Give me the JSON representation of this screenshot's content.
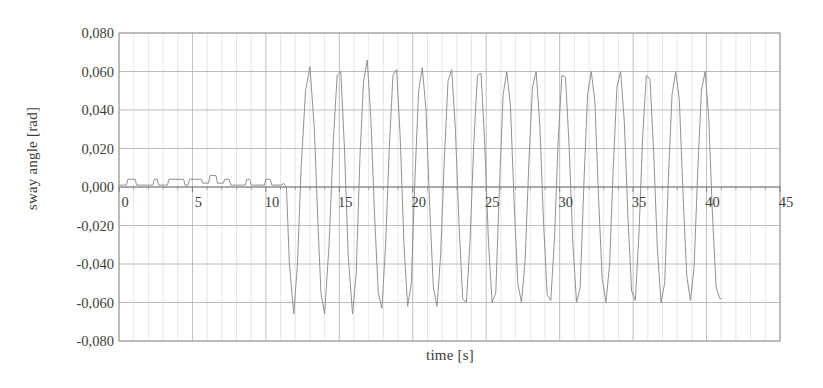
{
  "chart_data": {
    "type": "line",
    "title": "",
    "xlabel": "time [s]",
    "ylabel": "sway angle [rad]",
    "xlim": [
      0,
      45
    ],
    "ylim": [
      -0.08,
      0.08
    ],
    "xticks": [
      0,
      5,
      10,
      15,
      20,
      25,
      30,
      35,
      40,
      45
    ],
    "xtick_labels": [
      "0",
      "5",
      "10",
      "15",
      "20",
      "25",
      "30",
      "35",
      "40",
      "45"
    ],
    "yticks": [
      0.08,
      0.06,
      0.04,
      0.02,
      0.0,
      -0.02,
      -0.04,
      -0.06,
      -0.08
    ],
    "ytick_labels": [
      "0,080",
      "0,060",
      "0,040",
      "0,020",
      "0,000",
      "-0,020",
      "-0,040",
      "-0,060",
      "-0,080"
    ],
    "grid": "horizontal-major-and-vertical-minor",
    "legend": "none",
    "line_color": "#8c8c8c",
    "grid_color": "#b4b4b4",
    "axis_color": "#9a9a9a",
    "background": "#ffffff",
    "series": [
      {
        "name": "sway angle",
        "description": "Flat low-amplitude square-pulse segment from t=0 to t=11.4 s, then large sustained oscillation of amplitude about 0.062 rad and period about 2.5 s until t=41 s",
        "x": [
          0.0,
          0.5,
          0.6,
          1.1,
          1.2,
          2.3,
          2.4,
          2.6,
          2.7,
          3.3,
          3.4,
          4.4,
          4.5,
          4.7,
          4.8,
          5.6,
          5.7,
          6.1,
          6.2,
          6.6,
          6.7,
          7.1,
          7.2,
          7.5,
          7.6,
          8.6,
          8.7,
          8.9,
          9.0,
          9.9,
          10.0,
          10.3,
          10.4,
          11.1,
          11.2,
          11.4,
          11.6,
          11.9,
          12.15,
          12.4,
          12.7,
          13.0,
          13.3,
          13.55,
          13.75,
          14.0,
          14.3,
          14.6,
          14.85,
          15.1,
          15.35,
          15.6,
          15.9,
          16.15,
          16.4,
          16.65,
          16.9,
          17.15,
          17.4,
          17.65,
          17.9,
          18.15,
          18.4,
          18.65,
          18.9,
          19.15,
          19.4,
          19.65,
          19.9,
          20.15,
          20.4,
          20.65,
          20.9,
          21.15,
          21.4,
          21.65,
          21.9,
          22.15,
          22.4,
          22.65,
          22.9,
          23.15,
          23.4,
          23.65,
          23.9,
          24.15,
          24.4,
          24.65,
          24.9,
          25.15,
          25.4,
          25.65,
          25.9,
          26.15,
          26.4,
          26.65,
          26.9,
          27.15,
          27.4,
          27.65,
          27.9,
          28.15,
          28.4,
          28.65,
          28.9,
          29.15,
          29.4,
          29.65,
          29.9,
          30.15,
          30.4,
          30.65,
          30.9,
          31.15,
          31.4,
          31.65,
          31.9,
          32.15,
          32.4,
          32.65,
          32.9,
          33.15,
          33.4,
          33.65,
          33.9,
          34.15,
          34.4,
          34.65,
          34.9,
          35.15,
          35.4,
          35.65,
          35.9,
          36.15,
          36.4,
          36.65,
          36.9,
          37.15,
          37.4,
          37.65,
          37.9,
          38.15,
          38.4,
          38.65,
          38.9,
          39.15,
          39.4,
          39.65,
          39.9,
          40.15,
          40.4,
          40.65,
          40.9,
          41.0
        ],
        "y": [
          0.001,
          0.001,
          0.004,
          0.004,
          0.001,
          0.001,
          0.004,
          0.004,
          0.001,
          0.001,
          0.004,
          0.004,
          0.001,
          0.001,
          0.004,
          0.004,
          0.002,
          0.002,
          0.006,
          0.006,
          0.002,
          0.002,
          0.004,
          0.004,
          0.001,
          0.001,
          0.004,
          0.004,
          0.001,
          0.001,
          0.004,
          0.004,
          0.001,
          0.001,
          0.002,
          0.0,
          -0.04,
          -0.066,
          -0.04,
          0.01,
          0.05,
          0.0625,
          0.03,
          -0.02,
          -0.055,
          -0.066,
          -0.03,
          0.025,
          0.058,
          0.06,
          0.02,
          -0.035,
          -0.066,
          -0.045,
          0.015,
          0.055,
          0.066,
          0.035,
          -0.015,
          -0.055,
          -0.063,
          -0.03,
          0.02,
          0.058,
          0.061,
          0.025,
          -0.03,
          -0.062,
          -0.05,
          0.005,
          0.05,
          0.062,
          0.04,
          -0.01,
          -0.052,
          -0.062,
          -0.035,
          0.015,
          0.055,
          0.061,
          0.03,
          -0.02,
          -0.058,
          -0.06,
          -0.028,
          0.022,
          0.058,
          0.059,
          0.022,
          -0.028,
          -0.06,
          -0.055,
          0.0,
          0.048,
          0.06,
          0.042,
          -0.008,
          -0.05,
          -0.06,
          -0.038,
          0.012,
          0.052,
          0.06,
          0.032,
          -0.018,
          -0.056,
          -0.059,
          -0.026,
          0.024,
          0.058,
          0.057,
          0.02,
          -0.03,
          -0.06,
          -0.052,
          0.002,
          0.048,
          0.06,
          0.044,
          -0.006,
          -0.048,
          -0.06,
          -0.04,
          0.01,
          0.052,
          0.06,
          0.034,
          -0.016,
          -0.054,
          -0.059,
          -0.024,
          0.026,
          0.058,
          0.056,
          0.018,
          -0.032,
          -0.06,
          -0.05,
          0.004,
          0.048,
          0.06,
          0.045,
          -0.004,
          -0.046,
          -0.059,
          -0.042,
          0.008,
          0.05,
          0.06,
          0.036,
          -0.014,
          -0.052,
          -0.058,
          -0.058
        ]
      }
    ]
  }
}
